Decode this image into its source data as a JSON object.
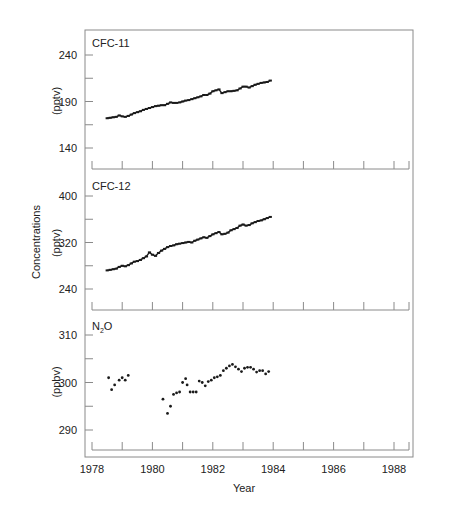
{
  "figure": {
    "ylabel_shared": "Concentrations",
    "xlabel": "Year",
    "x_ticks": [
      "1978",
      "1980",
      "1982",
      "1984",
      "1986",
      "1988"
    ]
  },
  "chart_data": [
    {
      "type": "line",
      "title": "CFC-11",
      "xlabel": "Year",
      "ylabel": "(pptv)",
      "ylim": [
        130,
        265
      ],
      "xlim": [
        1977.8,
        1989
      ],
      "y_ticks": [
        140,
        190,
        240
      ],
      "x_ticks": [
        1978,
        1980,
        1982,
        1984,
        1986,
        1988
      ],
      "grid": false,
      "x": [
        1978.5,
        1978.6,
        1978.7,
        1978.8,
        1978.9,
        1979.0,
        1979.1,
        1979.2,
        1979.3,
        1979.4,
        1979.5,
        1979.6,
        1979.7,
        1979.8,
        1979.9,
        1980.0,
        1980.1,
        1980.2,
        1980.3,
        1980.4,
        1980.5,
        1980.6,
        1980.7,
        1980.8,
        1980.9,
        1981.0,
        1981.1,
        1981.2,
        1981.3,
        1981.4,
        1981.5,
        1981.6,
        1981.7,
        1981.8,
        1981.9,
        1982.0,
        1982.1,
        1982.2,
        1982.3,
        1982.4,
        1982.5,
        1982.6,
        1982.7,
        1982.8,
        1982.9,
        1983.0,
        1983.1,
        1983.2,
        1983.3,
        1983.4,
        1983.5,
        1983.6,
        1983.7,
        1983.8,
        1983.9
      ],
      "values": [
        172,
        172.5,
        173,
        173.5,
        175,
        174,
        173.5,
        174.5,
        176,
        177.5,
        178.5,
        179.5,
        181,
        182,
        183,
        184,
        185,
        185.5,
        186,
        186,
        187.5,
        189,
        188.5,
        188.5,
        189,
        190,
        191,
        191.5,
        192.5,
        193.5,
        194.5,
        195.5,
        197,
        197,
        198.5,
        201,
        202,
        203,
        199,
        200,
        201,
        201,
        201.5,
        202,
        204,
        206,
        206,
        205,
        206.5,
        208,
        209,
        210,
        210.5,
        211,
        212.5
      ]
    },
    {
      "type": "line",
      "title": "CFC-12",
      "xlabel": "Year",
      "ylabel": "(pptv)",
      "ylim": [
        220,
        410
      ],
      "xlim": [
        1977.8,
        1989
      ],
      "y_ticks": [
        240,
        320,
        400
      ],
      "x_ticks": [
        1978,
        1980,
        1982,
        1984,
        1986,
        1988
      ],
      "grid": false,
      "x": [
        1978.5,
        1978.6,
        1978.7,
        1978.8,
        1978.9,
        1979.0,
        1979.1,
        1979.2,
        1979.3,
        1979.4,
        1979.5,
        1979.6,
        1979.7,
        1979.8,
        1979.9,
        1980.0,
        1980.1,
        1980.2,
        1980.3,
        1980.4,
        1980.5,
        1980.6,
        1980.7,
        1980.8,
        1980.9,
        1981.0,
        1981.1,
        1981.2,
        1981.3,
        1981.4,
        1981.5,
        1981.6,
        1981.7,
        1981.8,
        1981.9,
        1982.0,
        1982.1,
        1982.2,
        1982.3,
        1982.4,
        1982.5,
        1982.6,
        1982.7,
        1982.8,
        1982.9,
        1983.0,
        1983.1,
        1983.2,
        1983.3,
        1983.4,
        1983.5,
        1983.6,
        1983.7,
        1983.8,
        1983.9
      ],
      "values": [
        272,
        273,
        274,
        275,
        278,
        280,
        279,
        281,
        284,
        287,
        288,
        290,
        293,
        296,
        303,
        299,
        297,
        302,
        306,
        309,
        312,
        314,
        315,
        317,
        318,
        319,
        320,
        321,
        320,
        323,
        325,
        327,
        329,
        328,
        331,
        334,
        336,
        338,
        334,
        335,
        337,
        341,
        343,
        345,
        349,
        351,
        349,
        350,
        353,
        355,
        357,
        358,
        360,
        362,
        364
      ]
    },
    {
      "type": "scatter",
      "title": "N2O",
      "xlabel": "Year",
      "ylabel": "(ppbv)",
      "ylim": [
        285,
        313
      ],
      "xlim": [
        1977.8,
        1989
      ],
      "y_ticks": [
        290,
        300,
        310
      ],
      "x_ticks": [
        1978,
        1980,
        1982,
        1984,
        1986,
        1988
      ],
      "grid": false,
      "x": [
        1978.55,
        1978.65,
        1978.75,
        1978.9,
        1979.0,
        1979.1,
        1979.2,
        1980.35,
        1980.5,
        1980.6,
        1980.7,
        1980.8,
        1980.9,
        1981.0,
        1981.1,
        1981.15,
        1981.25,
        1981.35,
        1981.45,
        1981.55,
        1981.65,
        1981.75,
        1981.85,
        1981.95,
        1982.05,
        1982.15,
        1982.25,
        1982.35,
        1982.45,
        1982.55,
        1982.65,
        1982.75,
        1982.85,
        1982.95,
        1983.05,
        1983.15,
        1983.25,
        1983.35,
        1983.45,
        1983.55,
        1983.65,
        1983.75,
        1983.85
      ],
      "values": [
        301,
        298.5,
        299.5,
        300.5,
        301,
        300.5,
        301.5,
        296.5,
        293.5,
        295,
        297.5,
        297.8,
        298,
        300,
        300.8,
        299.5,
        298,
        298,
        298,
        300.3,
        300,
        299.3,
        300.2,
        300.5,
        301,
        301.2,
        301.5,
        302.5,
        303,
        303.5,
        303.8,
        303.3,
        302.8,
        302.3,
        303,
        303.2,
        303.2,
        302.8,
        302.2,
        302.5,
        302.5,
        301.8,
        302.3
      ]
    }
  ],
  "colors": {
    "frame": "#8a8a8a",
    "data": "#1a1a1a",
    "text": "#222222"
  }
}
